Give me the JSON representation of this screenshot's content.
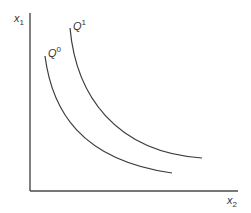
{
  "diagram": {
    "type": "isoquant-map",
    "axes": {
      "y_label": {
        "base": "x",
        "sub": "1"
      },
      "x_label": {
        "base": "x",
        "sub": "2"
      }
    },
    "curves": [
      {
        "id": "Q0",
        "label": {
          "base": "Q",
          "sup": "0"
        }
      },
      {
        "id": "Q1",
        "label": {
          "base": "Q",
          "sup": "1"
        }
      }
    ],
    "colors": {
      "line": "#3c3c3c",
      "axis": "#4a4a4a",
      "text": "#333333",
      "background": "#ffffff"
    }
  }
}
